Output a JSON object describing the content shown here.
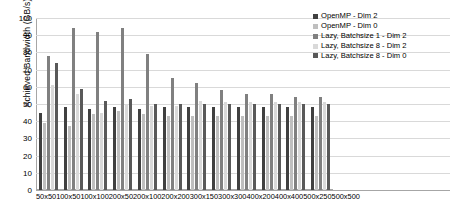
{
  "chart_data": {
    "type": "bar",
    "title": "",
    "xlabel": "",
    "ylabel": "Achieved Bandwidth (GB/s)",
    "ylim": [
      0,
      100
    ],
    "ytick_step": 10,
    "yticks": [
      0,
      10,
      20,
      30,
      40,
      50,
      60,
      70,
      80,
      90,
      100
    ],
    "grid": true,
    "legend_position": "top-right",
    "categories": [
      "50x50",
      "100x50",
      "100x100",
      "200x50",
      "200x100",
      "200x200",
      "300x150",
      "300x300",
      "400x200",
      "400x400",
      "500x250",
      "500x500"
    ],
    "series": [
      {
        "name": "OpenMP - Dim 2",
        "color": "#404040",
        "values": [
          45,
          48,
          47,
          48,
          47,
          48,
          48,
          48,
          48,
          48,
          48,
          48
        ]
      },
      {
        "name": "OpenMP - Dim 0",
        "color": "#bfbfbf",
        "values": [
          39,
          37,
          44,
          46,
          44,
          43,
          43,
          43,
          43,
          43,
          43,
          43
        ]
      },
      {
        "name": "Lazy, Batchsize 1 - Dim 2",
        "color": "#808080",
        "values": [
          78,
          94,
          92,
          94,
          79,
          65,
          62,
          58,
          56,
          56,
          54,
          54
        ]
      },
      {
        "name": "Lazy, Batchsize 8 - Dim 2",
        "color": "#d9d9d9",
        "values": [
          61,
          56,
          45,
          50,
          49,
          49,
          52,
          51,
          51,
          51,
          51,
          51
        ]
      },
      {
        "name": "Lazy, Batchsize 8 - Dim 0",
        "color": "#595959",
        "values": [
          74,
          59,
          52,
          53,
          50,
          50,
          50,
          50,
          50,
          50,
          50,
          50
        ]
      }
    ]
  },
  "axis": {
    "grid_color": "#d9d9d9",
    "axis_color": "#a6a6a6"
  }
}
